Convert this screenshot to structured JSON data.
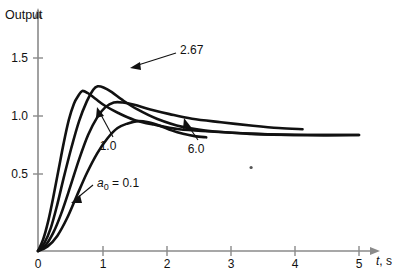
{
  "chart_data": {
    "type": "line",
    "title": "",
    "xlabel": "t, s",
    "ylabel": "Output",
    "xlim": [
      0,
      5.4
    ],
    "ylim": [
      0,
      1.72
    ],
    "grid": false,
    "legend_position": "inline-annotations",
    "x_ticks": [
      "0",
      "1",
      "2",
      "3",
      "4",
      "5"
    ],
    "x_tick_values": [
      0,
      1,
      2,
      3,
      4,
      5
    ],
    "y_ticks": [
      "0.5",
      "1.0",
      "1.5"
    ],
    "y_tick_values": [
      0.5,
      1.0,
      1.5
    ],
    "annotations": [
      {
        "name": "a0-0.1",
        "text_prefix": "a",
        "text_sub": "0",
        "text_suffix": " = 0.1",
        "label": "a0 = 0.1",
        "x": 0.93,
        "y": 0.55
      },
      {
        "name": "a0-1.0",
        "label": "1.0",
        "x": 1.13,
        "y": 0.82
      },
      {
        "name": "a0-2.67",
        "label": "2.67",
        "x": 1.78,
        "y": 1.55
      },
      {
        "name": "a0-6.0",
        "label": "6.0",
        "x": 2.43,
        "y": 0.78
      }
    ],
    "series": [
      {
        "name": "a0 = 0.1",
        "label": "0.1",
        "peak_x": 0.69,
        "peak_y": 1.38,
        "final_y": 1.0,
        "x_end": 5.0,
        "points": [
          [
            0,
            0
          ],
          [
            0.08,
            0.1
          ],
          [
            0.16,
            0.26
          ],
          [
            0.24,
            0.47
          ],
          [
            0.32,
            0.7
          ],
          [
            0.4,
            0.93
          ],
          [
            0.48,
            1.13
          ],
          [
            0.56,
            1.27
          ],
          [
            0.63,
            1.34
          ],
          [
            0.69,
            1.38
          ],
          [
            0.78,
            1.36
          ],
          [
            0.9,
            1.31
          ],
          [
            1.05,
            1.25
          ],
          [
            1.25,
            1.19
          ],
          [
            1.5,
            1.13
          ],
          [
            1.8,
            1.09
          ],
          [
            2.2,
            1.05
          ],
          [
            2.7,
            1.03
          ],
          [
            3.3,
            1.01
          ],
          [
            4.0,
            1.0
          ],
          [
            5.0,
            1.0
          ]
        ]
      },
      {
        "name": "a0 = 1.0",
        "label": "1.0",
        "peak_x": 0.93,
        "peak_y": 1.42,
        "final_y": 1.0,
        "x_end": 5.0,
        "points": [
          [
            0,
            0
          ],
          [
            0.1,
            0.07
          ],
          [
            0.2,
            0.2
          ],
          [
            0.3,
            0.4
          ],
          [
            0.4,
            0.63
          ],
          [
            0.52,
            0.89
          ],
          [
            0.64,
            1.12
          ],
          [
            0.76,
            1.29
          ],
          [
            0.86,
            1.39
          ],
          [
            0.93,
            1.42
          ],
          [
            1.02,
            1.41
          ],
          [
            1.15,
            1.37
          ],
          [
            1.32,
            1.3
          ],
          [
            1.55,
            1.22
          ],
          [
            1.85,
            1.14
          ],
          [
            2.25,
            1.07
          ],
          [
            2.75,
            1.03
          ],
          [
            3.4,
            1.01
          ],
          [
            4.2,
            1.0
          ],
          [
            5.0,
            1.0
          ]
        ]
      },
      {
        "name": "a0 = 2.67",
        "label": "2.67",
        "peak_x": 1.18,
        "peak_y": 1.28,
        "final_y": 1.05,
        "x_end": 4.12,
        "points": [
          [
            0,
            0
          ],
          [
            0.12,
            0.05
          ],
          [
            0.24,
            0.16
          ],
          [
            0.36,
            0.32
          ],
          [
            0.5,
            0.55
          ],
          [
            0.64,
            0.79
          ],
          [
            0.78,
            1.0
          ],
          [
            0.92,
            1.15
          ],
          [
            1.05,
            1.24
          ],
          [
            1.18,
            1.28
          ],
          [
            1.32,
            1.28
          ],
          [
            1.5,
            1.26
          ],
          [
            1.75,
            1.22
          ],
          [
            2.05,
            1.18
          ],
          [
            2.4,
            1.14
          ],
          [
            2.85,
            1.11
          ],
          [
            3.35,
            1.08
          ],
          [
            3.75,
            1.06
          ],
          [
            4.12,
            1.05
          ]
        ]
      },
      {
        "name": "a0 = 6.0",
        "label": "6.0",
        "peak_x": 1.55,
        "peak_y": 1.12,
        "final_y": 0.98,
        "x_end": 2.62,
        "points": [
          [
            0,
            0
          ],
          [
            0.15,
            0.04
          ],
          [
            0.3,
            0.13
          ],
          [
            0.45,
            0.28
          ],
          [
            0.6,
            0.47
          ],
          [
            0.76,
            0.67
          ],
          [
            0.92,
            0.84
          ],
          [
            1.08,
            0.97
          ],
          [
            1.24,
            1.06
          ],
          [
            1.4,
            1.1
          ],
          [
            1.55,
            1.12
          ],
          [
            1.72,
            1.11
          ],
          [
            1.9,
            1.08
          ],
          [
            2.08,
            1.04
          ],
          [
            2.26,
            1.01
          ],
          [
            2.44,
            0.99
          ],
          [
            2.62,
            0.98
          ]
        ]
      }
    ],
    "stray_dot": {
      "x": 3.32,
      "y": 0.72
    }
  },
  "figure": {
    "y_axis_title": "Output",
    "x_axis_title_italic": "t",
    "x_axis_title_rest": ", s"
  }
}
